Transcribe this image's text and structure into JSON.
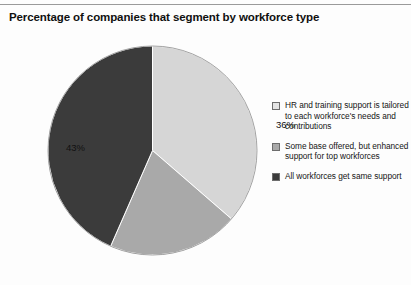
{
  "chart_data": {
    "type": "pie",
    "title": "Percentage of companies that segment by workforce type",
    "categories": [
      "HR and training support is tailored to each workforce's needs and contributions",
      "Some base offered, but enhanced support for top workforces",
      "All workforces get same support"
    ],
    "values": [
      36,
      20,
      43
    ],
    "value_labels": [
      "36%",
      "20%",
      "43%"
    ],
    "colors": [
      "#d6d6d6",
      "#a9a9a9",
      "#3b3b3b"
    ],
    "start_angle_deg": 0,
    "direction": "clockwise",
    "legend_position": "right",
    "grid": false,
    "xlabel": "",
    "ylabel": ""
  },
  "figure": {
    "title": "Percentage of companies that segment by workforce type",
    "background": "#fdfdfd",
    "rule_color": "#9a9a9a"
  },
  "pie": {
    "slices": [
      {
        "label": "36%",
        "value": 36,
        "color": "#d6d6d6",
        "name": "slice-tailored-support"
      },
      {
        "label": "20%",
        "value": 20,
        "color": "#a9a9a9",
        "name": "slice-some-base-offered"
      },
      {
        "label": "43%",
        "value": 43,
        "color": "#3b3b3b",
        "name": "slice-all-same-support"
      }
    ]
  },
  "legend": {
    "items": [
      {
        "text": "HR and training support is tailored to each workforce's needs and contributions",
        "color": "#e4e4e4"
      },
      {
        "text": "Some base offered, but enhanced support for top workforces",
        "color": "#a9a9a9"
      },
      {
        "text": "All workforces get same support",
        "color": "#3b3b3b"
      }
    ]
  }
}
